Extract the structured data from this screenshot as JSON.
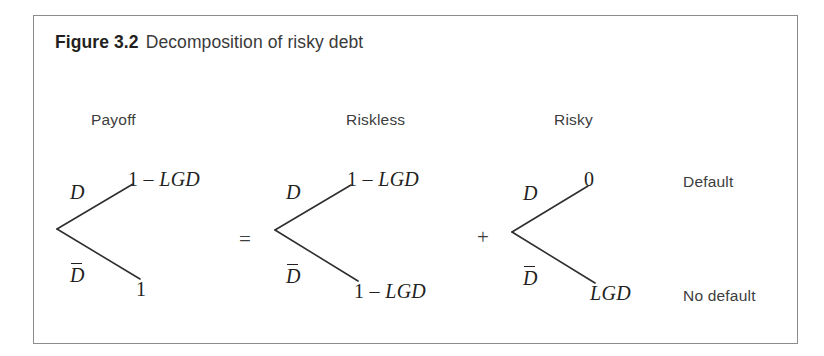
{
  "figure": {
    "caption_label": "Figure 3.2",
    "caption_text": "Decomposition of risky debt",
    "border_color": "#8c8c8c",
    "line_color": "#2f2f2f",
    "background": "#ffffff"
  },
  "columns": [
    {
      "id": "payoff",
      "label": "Payoff"
    },
    {
      "id": "riskless",
      "label": "Riskless"
    },
    {
      "id": "risky",
      "label": "Risky"
    }
  ],
  "operators": {
    "equals": "=",
    "plus": "+"
  },
  "branch_labels": {
    "default_branch": "D",
    "no_default_branch": "D"
  },
  "trees": [
    {
      "id": "payoff-tree",
      "column": "Payoff",
      "upper_branch_label": "D",
      "upper_branch_overbar": false,
      "upper_payoff_prefix": "1 – ",
      "upper_payoff_symbol": "LGD",
      "lower_branch_label": "D",
      "lower_branch_overbar": true,
      "lower_payoff_prefix": "",
      "lower_payoff_symbol": "1"
    },
    {
      "id": "riskless-tree",
      "column": "Riskless",
      "upper_branch_label": "D",
      "upper_branch_overbar": false,
      "upper_payoff_prefix": "1 – ",
      "upper_payoff_symbol": "LGD",
      "lower_branch_label": "D",
      "lower_branch_overbar": true,
      "lower_payoff_prefix": "1 – ",
      "lower_payoff_symbol": "LGD"
    },
    {
      "id": "risky-tree",
      "column": "Risky",
      "upper_branch_label": "D",
      "upper_branch_overbar": false,
      "upper_payoff_prefix": "",
      "upper_payoff_symbol": "0",
      "lower_branch_label": "D",
      "lower_branch_overbar": true,
      "lower_payoff_prefix": "",
      "lower_payoff_symbol": "LGD"
    }
  ],
  "outcomes": [
    {
      "id": "default",
      "label": "Default"
    },
    {
      "id": "no-default",
      "label": "No default"
    }
  ]
}
